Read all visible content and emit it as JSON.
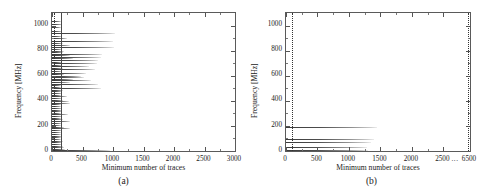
{
  "figure": {
    "panels": [
      {
        "id": "a",
        "caption": "(a)",
        "xlabel": "Minimum number of traces",
        "ylabel": "Frequency [MHz]"
      },
      {
        "id": "b",
        "caption": "(b)",
        "xlabel": "Minimum number of traces",
        "ylabel": "Frequency [MHz]"
      }
    ]
  },
  "chart_data": [
    {
      "type": "bar",
      "orientation": "horizontal",
      "panel": "a",
      "title": "",
      "xlabel": "Minimum number of traces",
      "ylabel": "Frequency [MHz]",
      "xlim": [
        0,
        3000
      ],
      "ylim": [
        0,
        1100
      ],
      "xticks": [
        0,
        500,
        1000,
        1500,
        2000,
        2500,
        3000
      ],
      "xticklabels": [
        "0",
        "500",
        "1000",
        "1500",
        "2000",
        "2500",
        "3000"
      ],
      "yticks": [
        0,
        200,
        400,
        600,
        800,
        1000
      ],
      "yticklabels": [
        "0",
        "200",
        "400",
        "600",
        "800",
        "1000"
      ],
      "grid": false,
      "legend": null,
      "reference_lines": [
        {
          "x": 30,
          "style": "dotted",
          "color": "#333333"
        },
        {
          "x": 150,
          "style": "solid",
          "color": "#4a4a4a"
        }
      ],
      "categories": [
        8,
        18,
        30,
        42,
        55,
        68,
        80,
        95,
        108,
        122,
        135,
        150,
        165,
        180,
        195,
        210,
        225,
        240,
        252,
        265,
        278,
        292,
        305,
        318,
        330,
        345,
        358,
        372,
        385,
        398,
        410,
        424,
        437,
        450,
        462,
        475,
        488,
        500,
        512,
        525,
        538,
        550,
        562,
        575,
        588,
        600,
        612,
        625,
        638,
        650,
        662,
        675,
        688,
        700,
        712,
        725,
        738,
        750,
        762,
        775,
        788,
        800,
        812,
        828,
        845,
        862,
        880,
        900,
        920,
        940,
        960,
        985,
        1010,
        1040
      ],
      "values": [
        950,
        210,
        200,
        185,
        170,
        160,
        175,
        150,
        140,
        165,
        150,
        150,
        160,
        290,
        200,
        140,
        170,
        300,
        180,
        155,
        160,
        270,
        150,
        160,
        165,
        170,
        155,
        145,
        300,
        280,
        185,
        160,
        250,
        150,
        170,
        160,
        175,
        810,
        155,
        150,
        760,
        300,
        640,
        340,
        520,
        480,
        200,
        560,
        160,
        700,
        175,
        600,
        170,
        740,
        160,
        760,
        350,
        800,
        300,
        820,
        180,
        200,
        160,
        1020,
        300,
        180,
        1000,
        250,
        170,
        1040,
        160,
        150,
        170,
        150
      ]
    },
    {
      "type": "bar",
      "orientation": "horizontal",
      "panel": "b",
      "title": "",
      "xlabel": "Minimum number of traces",
      "ylabel": "Frequency [MHz]",
      "xlim": [
        0,
        7000
      ],
      "ylim": [
        0,
        1100
      ],
      "xticks": [
        0,
        500,
        1000,
        1500,
        2000,
        2500,
        6500
      ],
      "xticklabels": [
        "0",
        "500",
        "1000",
        "1500",
        "2000",
        "2500",
        "6500"
      ],
      "xaxis_broken": true,
      "xaxis_break_marker": "...",
      "yticks": [
        0,
        200,
        400,
        600,
        800,
        1000
      ],
      "yticklabels": [
        "0",
        "200",
        "400",
        "600",
        "800",
        "1000"
      ],
      "grid": false,
      "legend": null,
      "reference_lines": [
        {
          "x": 100,
          "style": "dotted",
          "color": "#333333"
        },
        {
          "x": 6200,
          "style": "dotted",
          "color": "#333333"
        }
      ],
      "categories": [
        10,
        30,
        75,
        95,
        190
      ],
      "values": [
        1300,
        1280,
        1350,
        1400,
        1450
      ]
    }
  ]
}
